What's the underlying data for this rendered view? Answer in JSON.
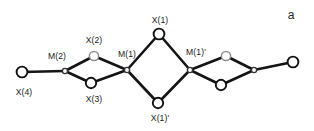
{
  "figure": {
    "panel_letter": "a",
    "background_color": "#ffffff",
    "edge_color": "#141414",
    "node_fill_color": "#ffffff",
    "node_stroke_color": "#111111",
    "faded_node_stroke_color": "#8f8f8f",
    "width": 314,
    "height": 131
  },
  "chart_data": {
    "type": "diagram",
    "title": "",
    "subtitle": "",
    "xlabel": "",
    "ylabel": "",
    "nodes": [
      {
        "id": "x4",
        "label": "X(4)",
        "x": 22,
        "y": 72,
        "r": 5.4,
        "style": "normal",
        "label_x": 24,
        "label_y": 92,
        "labeled": true
      },
      {
        "id": "m2",
        "label": "M(2)",
        "x": 65,
        "y": 71,
        "r": 2.6,
        "style": "small",
        "label_x": 57,
        "label_y": 56,
        "labeled": true
      },
      {
        "id": "x2",
        "label": "X(2)",
        "x": 94,
        "y": 56,
        "r": 4.6,
        "style": "faded",
        "label_x": 94,
        "label_y": 40,
        "labeled": true
      },
      {
        "id": "x3",
        "label": "X(3)",
        "x": 91,
        "y": 83,
        "r": 5.2,
        "style": "normal",
        "label_x": 94,
        "label_y": 99,
        "labeled": true
      },
      {
        "id": "m1",
        "label": "M(1)",
        "x": 127,
        "y": 70,
        "r": 2.6,
        "style": "small",
        "label_x": 127,
        "label_y": 54,
        "labeled": true
      },
      {
        "id": "x1",
        "label": "X(1)",
        "x": 159,
        "y": 34,
        "r": 5.4,
        "style": "normal",
        "label_x": 160,
        "label_y": 20,
        "labeled": true
      },
      {
        "id": "x1p",
        "label": "X(1)'",
        "x": 158,
        "y": 103,
        "r": 5.2,
        "style": "normal",
        "label_x": 160,
        "label_y": 118,
        "labeled": true
      },
      {
        "id": "m1p",
        "label": "M(1)'",
        "x": 190,
        "y": 70,
        "r": 2.6,
        "style": "small",
        "label_x": 196,
        "label_y": 52,
        "labeled": true
      },
      {
        "id": "x2p",
        "label": "",
        "x": 226,
        "y": 56,
        "r": 4.6,
        "style": "faded",
        "label_x": 226,
        "label_y": 40,
        "labeled": false
      },
      {
        "id": "x3p",
        "label": "",
        "x": 221,
        "y": 85,
        "r": 5.2,
        "style": "normal",
        "label_x": 221,
        "label_y": 101,
        "labeled": false
      },
      {
        "id": "m2p",
        "label": "",
        "x": 254,
        "y": 70,
        "r": 2.6,
        "style": "small",
        "label_x": 254,
        "label_y": 54,
        "labeled": false
      },
      {
        "id": "x4p",
        "label": "",
        "x": 293,
        "y": 62,
        "r": 5.4,
        "style": "normal",
        "label_x": 293,
        "label_y": 80,
        "labeled": false
      }
    ],
    "edges": [
      {
        "from": "x4",
        "to": "m2",
        "weight": "thick"
      },
      {
        "from": "m2",
        "to": "x2",
        "weight": "thick"
      },
      {
        "from": "m2",
        "to": "x3",
        "weight": "thick"
      },
      {
        "from": "x2",
        "to": "m1",
        "weight": "thick"
      },
      {
        "from": "x3",
        "to": "m1",
        "weight": "thick"
      },
      {
        "from": "m1",
        "to": "x1",
        "weight": "thick"
      },
      {
        "from": "m1",
        "to": "x1p",
        "weight": "thick"
      },
      {
        "from": "x1",
        "to": "m1p",
        "weight": "thick"
      },
      {
        "from": "x1p",
        "to": "m1p",
        "weight": "thick"
      },
      {
        "from": "m1p",
        "to": "x2p",
        "weight": "thick"
      },
      {
        "from": "m1p",
        "to": "x3p",
        "weight": "thick"
      },
      {
        "from": "x2p",
        "to": "m2p",
        "weight": "thick"
      },
      {
        "from": "x3p",
        "to": "m2p",
        "weight": "thick"
      },
      {
        "from": "m2p",
        "to": "x4p",
        "weight": "thick"
      }
    ]
  }
}
